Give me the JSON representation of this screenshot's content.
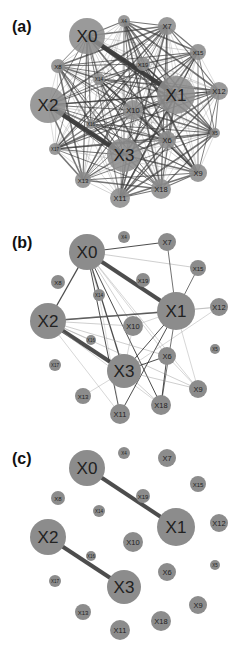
{
  "figure": {
    "panels": [
      {
        "id": "a",
        "label": "(a)",
        "top": 0,
        "edge_mode": "dense"
      },
      {
        "id": "b",
        "label": "(b)",
        "top": 216,
        "edge_mode": "medium"
      },
      {
        "id": "c",
        "label": "(c)",
        "top": 432,
        "edge_mode": "sparse"
      }
    ],
    "colors": {
      "node_fill": "#8c8c8c",
      "edge": "#3a3a3a",
      "edge_light": "#9a9a9a",
      "label": "#222222",
      "background": "#ffffff"
    },
    "nodes": [
      {
        "id": "X0",
        "x": 87,
        "y": 36,
        "r": 18
      },
      {
        "id": "X4",
        "x": 124,
        "y": 21,
        "r": 6
      },
      {
        "id": "X7",
        "x": 167,
        "y": 26,
        "r": 9
      },
      {
        "id": "X15",
        "x": 198,
        "y": 52,
        "r": 8
      },
      {
        "id": "X8",
        "x": 58,
        "y": 66,
        "r": 7
      },
      {
        "id": "X19",
        "x": 143,
        "y": 64,
        "r": 7
      },
      {
        "id": "X14",
        "x": 99,
        "y": 79,
        "r": 6
      },
      {
        "id": "X1",
        "x": 176,
        "y": 95,
        "r": 19
      },
      {
        "id": "X12",
        "x": 219,
        "y": 91,
        "r": 9
      },
      {
        "id": "X2",
        "x": 48,
        "y": 105,
        "r": 18
      },
      {
        "id": "X10",
        "x": 133,
        "y": 110,
        "r": 10
      },
      {
        "id": "X16",
        "x": 91,
        "y": 124,
        "r": 5
      },
      {
        "id": "X5",
        "x": 215,
        "y": 133,
        "r": 5
      },
      {
        "id": "X6",
        "x": 167,
        "y": 140,
        "r": 9
      },
      {
        "id": "X17",
        "x": 55,
        "y": 149,
        "r": 6
      },
      {
        "id": "X3",
        "x": 124,
        "y": 155,
        "r": 17
      },
      {
        "id": "X13",
        "x": 83,
        "y": 180,
        "r": 8
      },
      {
        "id": "X9",
        "x": 198,
        "y": 173,
        "r": 9
      },
      {
        "id": "X18",
        "x": 161,
        "y": 189,
        "r": 10
      },
      {
        "id": "X11",
        "x": 120,
        "y": 198,
        "r": 10
      }
    ],
    "edges": {
      "a": "all-pairs",
      "b": [
        [
          "X0",
          "X1",
          4
        ],
        [
          "X2",
          "X3",
          4
        ],
        [
          "X0",
          "X2",
          1.3
        ],
        [
          "X0",
          "X7",
          1
        ],
        [
          "X0",
          "X15",
          0.6
        ],
        [
          "X0",
          "X3",
          1.3
        ],
        [
          "X0",
          "X11",
          1
        ],
        [
          "X0",
          "X18",
          1
        ],
        [
          "X0",
          "X10",
          0.6
        ],
        [
          "X0",
          "X14",
          0.5
        ],
        [
          "X0",
          "X6",
          0.5
        ],
        [
          "X0",
          "X9",
          0.5
        ],
        [
          "X2",
          "X1",
          1.3
        ],
        [
          "X2",
          "X10",
          0.6
        ],
        [
          "X2",
          "X6",
          0.6
        ],
        [
          "X2",
          "X9",
          0.6
        ],
        [
          "X2",
          "X18",
          0.5
        ],
        [
          "X2",
          "X11",
          0.5
        ],
        [
          "X2",
          "X16",
          0.5
        ],
        [
          "X1",
          "X3",
          1
        ],
        [
          "X1",
          "X11",
          1
        ],
        [
          "X1",
          "X18",
          0.8
        ],
        [
          "X1",
          "X15",
          0.8
        ],
        [
          "X1",
          "X12",
          0.6
        ],
        [
          "X1",
          "X7",
          0.8
        ],
        [
          "X1",
          "X9",
          0.5
        ],
        [
          "X1",
          "X10",
          0.5
        ],
        [
          "X3",
          "X6",
          1
        ],
        [
          "X3",
          "X12",
          0.5
        ],
        [
          "X3",
          "X9",
          0.6
        ],
        [
          "X3",
          "X13",
          0.5
        ],
        [
          "X6",
          "X18",
          1
        ],
        [
          "X6",
          "X9",
          0.5
        ],
        [
          "X12",
          "X2",
          0.4
        ],
        [
          "X3",
          "X18",
          0.6
        ],
        [
          "X10",
          "X3",
          0.5
        ],
        [
          "X14",
          "X11",
          0.4
        ]
      ],
      "c": [
        [
          "X0",
          "X1",
          4
        ],
        [
          "X2",
          "X3",
          4
        ]
      ]
    }
  }
}
